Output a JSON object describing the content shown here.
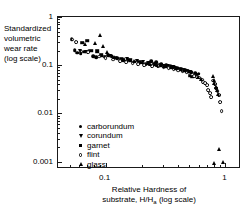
{
  "chart_data": {
    "type": "scatter",
    "title": "",
    "xlabel": "Relative Hardness of substrate, H/Ha (log scale)",
    "ylabel": "Standardized volumetric wear rate (log scale)",
    "xscale": "log",
    "yscale": "log",
    "xlim": [
      0.04,
      1.35
    ],
    "ylim": [
      0.0007,
      1.0
    ],
    "grid": false,
    "legend_position": "lower-left-inside",
    "x_ticks_labeled": [
      "0.1",
      "1"
    ],
    "y_ticks_labeled": [
      "1",
      "0.1",
      "0.01",
      "0.001"
    ],
    "series": [
      {
        "name": "carborundum",
        "marker": "circle-filled",
        "points": [
          [
            0.052,
            0.35
          ],
          [
            0.055,
            0.205
          ],
          [
            0.058,
            0.18
          ],
          [
            0.062,
            0.175
          ],
          [
            0.066,
            0.19
          ],
          [
            0.072,
            0.2
          ],
          [
            0.079,
            0.155
          ],
          [
            0.083,
            0.148
          ],
          [
            0.105,
            0.162
          ],
          [
            0.112,
            0.152
          ],
          [
            0.125,
            0.14
          ],
          [
            0.14,
            0.128
          ],
          [
            0.155,
            0.13
          ],
          [
            0.175,
            0.118
          ],
          [
            0.195,
            0.112
          ],
          [
            0.215,
            0.106
          ],
          [
            0.24,
            0.12
          ],
          [
            0.265,
            0.115
          ],
          [
            0.29,
            0.105
          ],
          [
            0.32,
            0.1
          ],
          [
            0.35,
            0.098
          ],
          [
            0.375,
            0.092
          ],
          [
            0.4,
            0.088
          ],
          [
            0.43,
            0.082
          ],
          [
            0.46,
            0.078
          ],
          [
            0.49,
            0.073
          ],
          [
            0.52,
            0.071
          ],
          [
            0.56,
            0.068
          ],
          [
            0.6,
            0.066
          ]
        ]
      },
      {
        "name": "corundum",
        "marker": "triangle-down",
        "points": [
          [
            0.061,
            0.196
          ],
          [
            0.068,
            0.188
          ],
          [
            0.108,
            0.158
          ],
          [
            0.15,
            0.137
          ],
          [
            0.182,
            0.122
          ],
          [
            0.205,
            0.115
          ],
          [
            0.232,
            0.109
          ],
          [
            0.262,
            0.104
          ],
          [
            0.3,
            0.098
          ],
          [
            0.33,
            0.095
          ],
          [
            0.365,
            0.09
          ],
          [
            0.395,
            0.085
          ],
          [
            0.43,
            0.08
          ],
          [
            0.47,
            0.076
          ],
          [
            0.51,
            0.072
          ]
        ]
      },
      {
        "name": "garnet",
        "marker": "square-filled",
        "points": [
          [
            0.064,
            0.292
          ],
          [
            0.07,
            0.32
          ],
          [
            0.076,
            0.2
          ],
          [
            0.085,
            0.196
          ],
          [
            0.092,
            0.16
          ],
          [
            0.098,
            0.15
          ],
          [
            0.12,
            0.142
          ],
          [
            0.135,
            0.134
          ],
          [
            0.16,
            0.126
          ],
          [
            0.19,
            0.118
          ],
          [
            0.225,
            0.11
          ],
          [
            0.255,
            0.106
          ],
          [
            0.285,
            0.1
          ],
          [
            0.315,
            0.096
          ],
          [
            0.345,
            0.092
          ],
          [
            0.38,
            0.086
          ],
          [
            0.41,
            0.082
          ],
          [
            0.445,
            0.078
          ],
          [
            0.48,
            0.074
          ],
          [
            0.505,
            0.06
          ],
          [
            0.53,
            0.058
          ],
          [
            0.57,
            0.064
          ]
        ]
      },
      {
        "name": "flint",
        "marker": "circle-open",
        "points": [
          [
            0.053,
            0.34
          ],
          [
            0.057,
            0.3
          ],
          [
            0.063,
            0.192
          ],
          [
            0.071,
            0.186
          ],
          [
            0.088,
            0.15
          ],
          [
            0.1,
            0.138
          ],
          [
            0.115,
            0.13
          ],
          [
            0.133,
            0.122
          ],
          [
            0.148,
            0.118
          ],
          [
            0.168,
            0.112
          ],
          [
            0.188,
            0.106
          ],
          [
            0.21,
            0.1
          ],
          [
            0.245,
            0.097
          ],
          [
            0.275,
            0.094
          ],
          [
            0.305,
            0.09
          ],
          [
            0.335,
            0.086
          ],
          [
            0.37,
            0.081
          ],
          [
            0.405,
            0.077
          ],
          [
            0.44,
            0.074
          ],
          [
            0.475,
            0.07
          ],
          [
            0.545,
            0.06
          ],
          [
            0.58,
            0.057
          ],
          [
            0.61,
            0.055
          ],
          [
            0.64,
            0.05
          ],
          [
            0.655,
            0.045
          ],
          [
            0.68,
            0.042
          ],
          [
            0.7,
            0.038
          ],
          [
            0.72,
            0.03
          ],
          [
            0.74,
            0.026
          ],
          [
            0.76,
            0.022
          ],
          [
            0.79,
            0.048
          ],
          [
            0.82,
            0.04
          ],
          [
            0.84,
            0.033
          ],
          [
            0.86,
            0.029
          ],
          [
            0.88,
            0.024
          ],
          [
            0.9,
            0.017
          ],
          [
            0.93,
            0.011
          ]
        ]
      },
      {
        "name": "glass",
        "marker": "triangle-up",
        "points": [
          [
            0.067,
            0.27
          ],
          [
            0.081,
            0.285
          ],
          [
            0.09,
            0.42
          ],
          [
            0.095,
            0.245
          ],
          [
            0.102,
            0.188
          ],
          [
            0.118,
            0.146
          ],
          [
            0.143,
            0.132
          ],
          [
            0.172,
            0.12
          ],
          [
            0.2,
            0.114
          ],
          [
            0.235,
            0.108
          ],
          [
            0.27,
            0.102
          ],
          [
            0.31,
            0.097
          ],
          [
            0.355,
            0.092
          ],
          [
            0.39,
            0.088
          ],
          [
            0.425,
            0.084
          ],
          [
            0.455,
            0.08
          ],
          [
            0.595,
            0.056
          ],
          [
            0.625,
            0.052
          ],
          [
            0.79,
            0.06
          ],
          [
            0.8,
            0.05
          ],
          [
            0.81,
            0.042
          ],
          [
            0.83,
            0.036
          ],
          [
            0.85,
            0.03
          ],
          [
            0.87,
            0.025
          ],
          [
            0.88,
            0.0018
          ],
          [
            0.81,
            0.00095
          ],
          [
            0.96,
            0.001
          ]
        ]
      }
    ]
  },
  "axes": {
    "y_title": "Standardized\nvolumetric\nwear rate\n(log scale)",
    "y_title_lines": [
      "Standardized",
      "volumetric",
      "wear rate",
      "(log scale)"
    ],
    "x_title_line1": "Relative Hardness of",
    "x_title_line2_pre": "substrate, H/H",
    "x_title_sub": "a",
    "x_title_line2_post": " (log scale)"
  },
  "legend": {
    "items": [
      {
        "label": "carborundum",
        "marker": "circle-filled"
      },
      {
        "label": "corundum",
        "marker": "triangle-down"
      },
      {
        "label": "garnet",
        "marker": "square-filled"
      },
      {
        "label": "flint",
        "marker": "circle-open"
      },
      {
        "label": "glass",
        "marker": "triangle-up"
      }
    ]
  },
  "colors": {
    "axis": "#1a1a1a",
    "marker": "#000000",
    "background": "#ffffff"
  }
}
